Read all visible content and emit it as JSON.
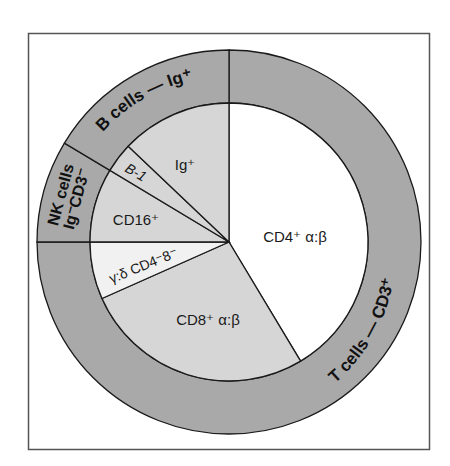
{
  "colors": {
    "ring": "#a9a9a9",
    "wedge_gray": "#d6d6d6",
    "wedge_light": "#f1f1f1",
    "wedge_white": "#ffffff",
    "stroke": "#1a1a1a",
    "frame": "#555555"
  },
  "outer_ring": [
    {
      "id": "t-cells",
      "label": "T cells — CD3⁺",
      "start_deg": 270,
      "end_deg": 540
    },
    {
      "id": "nk-cells",
      "label_line1": "NK cells",
      "label_line2": "Ig⁻CD3⁻",
      "start_deg": 180,
      "end_deg": 211
    },
    {
      "id": "b-cells",
      "label": "B cells — Ig⁺",
      "start_deg": 211,
      "end_deg": 270
    }
  ],
  "inner_wedges": [
    {
      "id": "cd4",
      "label": "CD4⁺ α:β",
      "start_deg": 270,
      "end_deg": 419,
      "fill": "white"
    },
    {
      "id": "cd8",
      "label": "CD8⁺ α:β",
      "start_deg": 59,
      "end_deg": 156,
      "fill": "gray"
    },
    {
      "id": "gamma-delta",
      "label": "γ:δ CD4⁻8⁻",
      "start_deg": 156,
      "end_deg": 180,
      "fill": "light"
    },
    {
      "id": "cd16",
      "label": "CD16⁺",
      "start_deg": 180,
      "end_deg": 211,
      "fill": "gray"
    },
    {
      "id": "b1",
      "label": "B-1",
      "start_deg": 211,
      "end_deg": 223.5,
      "fill": "gray"
    },
    {
      "id": "ig",
      "label": "Ig⁺",
      "start_deg": 223.5,
      "end_deg": 270,
      "fill": "gray"
    }
  ],
  "labels": {
    "t_cells": "T cells — CD3⁺",
    "b_cells": "B cells — Ig⁺",
    "nk_line1": "NK cells",
    "nk_line2": "Ig⁻CD3⁻",
    "cd4": "CD4⁺ α:β",
    "cd8": "CD8⁺ α:β",
    "gamma_delta": "γ:δ CD4⁻8⁻",
    "cd16": "CD16⁺",
    "b1": "B-1",
    "ig": "Ig⁺"
  }
}
